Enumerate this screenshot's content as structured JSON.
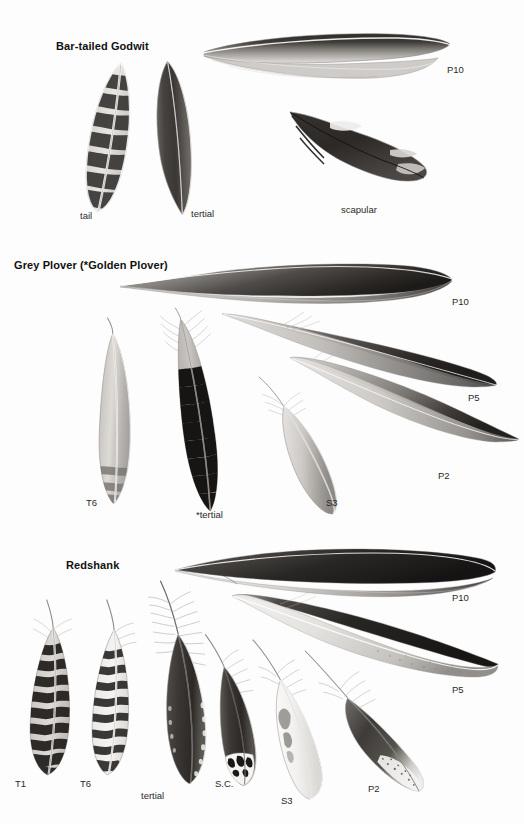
{
  "plate": {
    "title": "Feather identification plate",
    "background_color": "#fdfdfd",
    "width": 524,
    "height": 824,
    "ink_color": "#1a1a1a"
  },
  "sections": [
    {
      "id": "bar-tailed-godwit",
      "title": "Bar-tailed Godwit",
      "title_pos": {
        "x": 56,
        "y": 40
      },
      "feathers": [
        {
          "label": "tail",
          "label_pos": {
            "x": 80,
            "y": 210
          },
          "shape": {
            "x": 88,
            "y": 63,
            "w": 42,
            "h": 150,
            "rot": 9
          },
          "pattern": "barred",
          "tone": "mid",
          "bars": 8
        },
        {
          "label": "tertial",
          "label_pos": {
            "x": 191,
            "y": 208
          },
          "shape": {
            "x": 148,
            "y": 62,
            "w": 44,
            "h": 150,
            "rot": -5
          },
          "pattern": "plain-dark",
          "tone": "dark",
          "bars": 0
        },
        {
          "label": "P10",
          "label_pos": {
            "x": 447,
            "y": 64
          },
          "shape": {
            "x": 200,
            "y": 28,
            "w": 250,
            "h": 62,
            "rot": 0
          },
          "pattern": "primary-long",
          "tone": "dark",
          "bars": 0
        },
        {
          "label": "scapular",
          "label_pos": {
            "x": 341,
            "y": 204
          },
          "shape": {
            "x": 288,
            "y": 108,
            "w": 142,
            "h": 82,
            "rot": 0
          },
          "pattern": "notched",
          "tone": "dark",
          "bars": 0
        }
      ]
    },
    {
      "id": "grey-plover",
      "title": "Grey Plover (*Golden Plover)",
      "title_pos": {
        "x": 14,
        "y": 259
      },
      "feathers": [
        {
          "label": "P10",
          "label_pos": {
            "x": 452,
            "y": 296
          },
          "shape": {
            "x": 120,
            "y": 262,
            "w": 330,
            "h": 50,
            "rot": 0
          },
          "pattern": "primary-long",
          "tone": "dark",
          "bars": 0
        },
        {
          "label": "P5",
          "label_pos": {
            "x": 468,
            "y": 392
          },
          "shape": {
            "x": 222,
            "y": 310,
            "w": 275,
            "h": 72,
            "rot": 0
          },
          "pattern": "primary-long",
          "tone": "dark",
          "bars": 0
        },
        {
          "label": "P2",
          "label_pos": {
            "x": 438,
            "y": 470
          },
          "shape": {
            "x": 290,
            "y": 356,
            "w": 230,
            "h": 80,
            "rot": 0
          },
          "pattern": "primary-long",
          "tone": "mid",
          "bars": 0
        },
        {
          "label": "T6",
          "label_pos": {
            "x": 86,
            "y": 497
          },
          "shape": {
            "x": 88,
            "y": 320,
            "w": 48,
            "h": 180,
            "rot": 2
          },
          "pattern": "plain-light",
          "tone": "light",
          "bars": 3
        },
        {
          "label": "*tertial",
          "label_pos": {
            "x": 196,
            "y": 509
          },
          "shape": {
            "x": 168,
            "y": 310,
            "w": 52,
            "h": 200,
            "rot": -8
          },
          "pattern": "notched-dark",
          "tone": "very-dark",
          "bars": 9
        },
        {
          "label": "S3",
          "label_pos": {
            "x": 326,
            "y": 497
          },
          "shape": {
            "x": 268,
            "y": 375,
            "w": 72,
            "h": 140,
            "rot": -8
          },
          "pattern": "plain-light",
          "tone": "light",
          "bars": 0
        }
      ]
    },
    {
      "id": "redshank",
      "title": "Redshank",
      "title_pos": {
        "x": 66,
        "y": 559
      },
      "feathers": [
        {
          "label": "P10",
          "label_pos": {
            "x": 452,
            "y": 592
          },
          "shape": {
            "x": 175,
            "y": 548,
            "w": 320,
            "h": 48,
            "rot": 0
          },
          "pattern": "primary-long",
          "tone": "dark",
          "bars": 0
        },
        {
          "label": "P5",
          "label_pos": {
            "x": 452,
            "y": 684
          },
          "shape": {
            "x": 232,
            "y": 592,
            "w": 265,
            "h": 80,
            "rot": 0
          },
          "pattern": "primary-long",
          "tone": "dark",
          "bars": 0
        },
        {
          "label": "T1",
          "label_pos": {
            "x": 15,
            "y": 778
          },
          "shape": {
            "x": 22,
            "y": 606,
            "w": 52,
            "h": 162,
            "rot": 3
          },
          "pattern": "barred",
          "tone": "mid",
          "bars": 10
        },
        {
          "label": "T6",
          "label_pos": {
            "x": 80,
            "y": 778
          },
          "shape": {
            "x": 86,
            "y": 606,
            "w": 50,
            "h": 162,
            "rot": 3
          },
          "pattern": "barred-light",
          "tone": "light",
          "bars": 10
        },
        {
          "label": "tertial",
          "label_pos": {
            "x": 141,
            "y": 790
          },
          "shape": {
            "x": 148,
            "y": 584,
            "w": 58,
            "h": 198,
            "rot": -3
          },
          "pattern": "plumulaceous",
          "tone": "dark",
          "bars": 0
        },
        {
          "label": "S.C.",
          "label_pos": {
            "x": 215,
            "y": 778
          },
          "shape": {
            "x": 208,
            "y": 638,
            "w": 48,
            "h": 144,
            "rot": -5
          },
          "pattern": "plain-dark",
          "tone": "dark",
          "bars": 0
        },
        {
          "label": "S3",
          "label_pos": {
            "x": 281,
            "y": 795
          },
          "shape": {
            "x": 266,
            "y": 640,
            "w": 60,
            "h": 155,
            "rot": -8
          },
          "pattern": "plain-light",
          "tone": "light",
          "bars": 0
        },
        {
          "label": "P2",
          "label_pos": {
            "x": 368,
            "y": 783
          },
          "shape": {
            "x": 318,
            "y": 645,
            "w": 110,
            "h": 145,
            "rot": -12
          },
          "pattern": "primary-short",
          "tone": "mid",
          "bars": 0
        }
      ]
    }
  ]
}
